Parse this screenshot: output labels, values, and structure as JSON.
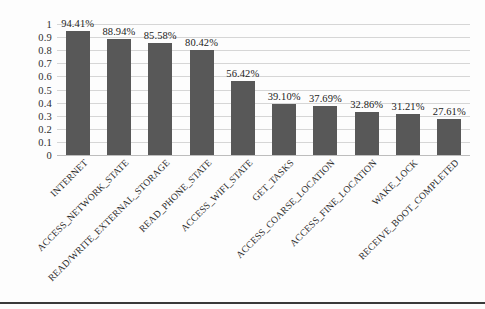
{
  "chart_data": {
    "type": "bar",
    "title": "",
    "xlabel": "",
    "ylabel": "",
    "ylim": [
      0,
      1
    ],
    "yticks": [
      "0",
      "0.1",
      "0.2",
      "0.3",
      "0.4",
      "0.5",
      "0.6",
      "0.7",
      "0.8",
      "0.9",
      "1"
    ],
    "ytick_values": [
      0,
      0.1,
      0.2,
      0.3,
      0.4,
      0.5,
      0.6,
      0.7,
      0.8,
      0.9,
      1
    ],
    "grid": true,
    "legend": false,
    "orientation": "vertical",
    "bar_color": "#585858",
    "gridline_color": "#d6d6d6",
    "label_rotation_deg": -45,
    "categories": [
      "INTERNET",
      "ACCESS_NETWORK_STATE",
      "READ/WRITE_EXTERNAL_STORAGE",
      "READ_PHONE_STATE",
      "ACCESS_WIFI_STATE",
      "GET_TASKS",
      "ACCESS_COARSE_LOCATION",
      "ACCESS_FINE_LOCATION",
      "WAKE_LOCK",
      "RECEIVE_BOOT_COMPLETED"
    ],
    "values": [
      0.9441,
      0.8894,
      0.8558,
      0.8042,
      0.5642,
      0.391,
      0.3769,
      0.3286,
      0.3121,
      0.2761
    ],
    "data_labels": [
      "94.41%",
      "88.94%",
      "85.58%",
      "80.42%",
      "56.42%",
      "39.10%",
      "37.69%",
      "32.86%",
      "31.21%",
      "27.61%"
    ]
  }
}
